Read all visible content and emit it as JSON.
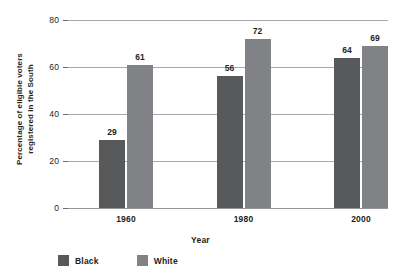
{
  "chart_data": {
    "type": "bar",
    "title": "",
    "xlabel": "Year",
    "ylabel": "Percentage of eligible voters registered in the South",
    "ylabel_line1": "Percentage of eligible voters",
    "ylabel_line2": "registered in the South",
    "categories": [
      "1960",
      "1980",
      "2000"
    ],
    "series": [
      {
        "name": "Black",
        "color": "#58595b",
        "values": [
          29,
          56,
          64
        ]
      },
      {
        "name": "White",
        "color": "#808285",
        "values": [
          61,
          72,
          69
        ]
      }
    ],
    "ylim": [
      0,
      80
    ],
    "yticks": [
      0,
      20,
      40,
      60,
      80
    ],
    "ytick_labels": [
      "0",
      "20",
      "40",
      "60",
      "80"
    ],
    "grid": true,
    "grid_axis": "y",
    "legend_position": "bottom-left",
    "data_labels": true
  },
  "legend": {
    "items": [
      {
        "label": "Black",
        "color": "#58595b"
      },
      {
        "label": "White",
        "color": "#808285"
      }
    ]
  },
  "colors": {
    "black_series": "#58595b",
    "white_series": "#808285",
    "gridline": "#a7a9ac",
    "text": "#231f20",
    "background": "#ffffff"
  }
}
